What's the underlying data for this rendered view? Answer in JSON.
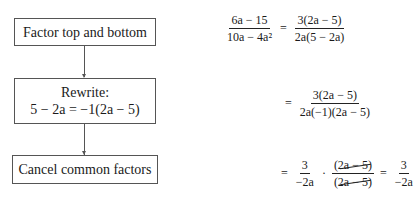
{
  "flowchart": {
    "steps": [
      {
        "label": "Factor top and bottom"
      },
      {
        "label_line1": "Rewrite:",
        "label_line2": "5 − 2a = −1(2a − 5)"
      },
      {
        "label": "Cancel common factors"
      }
    ]
  },
  "equations": {
    "step1": {
      "lhs_num": "6a − 15",
      "lhs_den": "10a − 4a²",
      "eq": "=",
      "rhs_num": "3(2a − 5)",
      "rhs_den": "2a(5 − 2a)"
    },
    "step2": {
      "eq": "=",
      "num": "3(2a − 5)",
      "den": "2a(−1)(2a − 5)"
    },
    "step3": {
      "eq1": "=",
      "f1_num": "3",
      "f1_den": "−2a",
      "dot": "·",
      "f2_num": "(2a − 5)",
      "f2_den": "(2a − 5)",
      "eq2": "=",
      "f3_num": "3",
      "f3_den": "−2a"
    }
  }
}
